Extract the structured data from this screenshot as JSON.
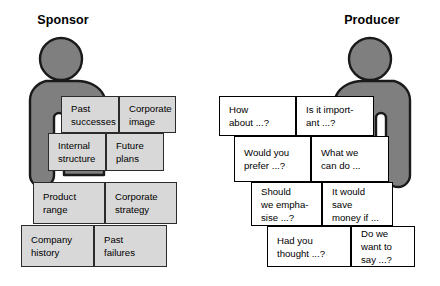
{
  "canvas": {
    "width": 440,
    "height": 286,
    "background": "#ffffff"
  },
  "palette": {
    "figure_fill": "#7f7f7f",
    "figure_stroke": "#1a1a1a",
    "grey_block_fill": "#d8d8d8",
    "grey_block_stroke": "#2b2b2b",
    "white_block_fill": "#ffffff",
    "white_block_stroke": "#000000",
    "text": "#000000"
  },
  "left": {
    "title": "Sponsor",
    "figure_name": "sponsor-person-icon",
    "blocks": [
      {
        "id": "past-successes",
        "text": "Past\nsuccesses",
        "x": 61,
        "y": 96,
        "w": 58,
        "h": 37
      },
      {
        "id": "corporate-image",
        "text": "Corporate\nimage",
        "x": 119,
        "y": 96,
        "w": 57,
        "h": 37
      },
      {
        "id": "internal-structure",
        "text": "Internal\nstructure",
        "x": 48,
        "y": 133,
        "w": 58,
        "h": 38
      },
      {
        "id": "future-plans",
        "text": "Future\nplans",
        "x": 106,
        "y": 133,
        "w": 58,
        "h": 38
      },
      {
        "id": "product-range",
        "text": "Product\nrange",
        "x": 33,
        "y": 182,
        "w": 72,
        "h": 42
      },
      {
        "id": "corporate-strategy",
        "text": "Corporate\nstrategy",
        "x": 105,
        "y": 182,
        "w": 72,
        "h": 42
      },
      {
        "id": "company-history",
        "text": "Company\nhistory",
        "x": 21,
        "y": 225,
        "w": 73,
        "h": 42
      },
      {
        "id": "past-failures",
        "text": "Past\nfailures",
        "x": 94,
        "y": 225,
        "w": 73,
        "h": 42
      }
    ]
  },
  "right": {
    "title": "Producer",
    "figure_name": "producer-person-icon",
    "blocks": [
      {
        "id": "how-about",
        "text": "How\nabout ...?",
        "x": 219,
        "y": 96,
        "w": 77,
        "h": 40
      },
      {
        "id": "is-it-important",
        "text": "Is it import-\nant ...?",
        "x": 296,
        "y": 96,
        "w": 78,
        "h": 40
      },
      {
        "id": "would-you-prefer",
        "text": "Would you\nprefer ...?",
        "x": 234,
        "y": 136,
        "w": 77,
        "h": 46
      },
      {
        "id": "what-we-can-do",
        "text": "What we\ncan do ...",
        "x": 311,
        "y": 136,
        "w": 78,
        "h": 46
      },
      {
        "id": "should-we-emphasise",
        "text": "Should\nwe empha-\nsise ...?",
        "x": 251,
        "y": 182,
        "w": 71,
        "h": 44
      },
      {
        "id": "it-would-save",
        "text": "It would\nsave\nmoney if ...",
        "x": 322,
        "y": 182,
        "w": 71,
        "h": 44
      },
      {
        "id": "had-you-thought",
        "text": "Had you\nthought ...?",
        "x": 267,
        "y": 226,
        "w": 84,
        "h": 41
      },
      {
        "id": "do-we-want-to-say",
        "text": "Do we\nwant to\nsay ...?",
        "x": 351,
        "y": 226,
        "w": 64,
        "h": 41
      }
    ]
  }
}
